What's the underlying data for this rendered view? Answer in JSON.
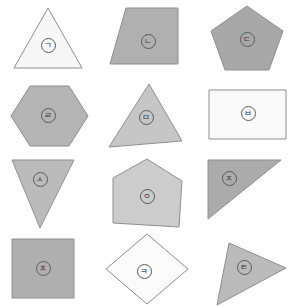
{
  "canvas": {
    "width": 297,
    "height": 306,
    "background": "#ffffff",
    "grid_columns": 3,
    "grid_rows": 4
  },
  "style": {
    "stroke_color": "#8f8f8f",
    "stroke_width": 1,
    "label_ring_color": "#5a5a5a",
    "label_text_color": "#3a3a3a"
  },
  "shapes": [
    {
      "label": "ㄱ",
      "name": "triangle",
      "fill": "#f7f7f7",
      "cell": {
        "col": 0,
        "row": 0
      },
      "points": "33,6 63,6 63,6",
      "polygon": "48,8 14,68 82,68",
      "label_pos": {
        "x": 48,
        "y": 45
      }
    },
    {
      "label": "ㄴ",
      "name": "quadrilateral",
      "fill": "#b0b0b0",
      "cell": {
        "col": 1,
        "row": 0
      },
      "polygon": "27,8 79,8 79,64 11,64",
      "label_pos": {
        "x": 49,
        "y": 41
      }
    },
    {
      "label": "ㄷ",
      "name": "pentagon",
      "fill": "#a8a8a8",
      "cell": {
        "col": 2,
        "row": 0
      },
      "polygon": "49,6 85,31 71,70 27,70 13,31",
      "label_pos": {
        "x": 49,
        "y": 39
      }
    },
    {
      "label": "ㄹ",
      "name": "hexagon",
      "fill": "#b4b4b4",
      "cell": {
        "col": 0,
        "row": 1
      },
      "polygon": "30,9 69,9 88,39 69,69 30,69 11,39",
      "label_pos": {
        "x": 48,
        "y": 39
      }
    },
    {
      "label": "ㅁ",
      "name": "triangle",
      "fill": "#c6c6c6",
      "cell": {
        "col": 1,
        "row": 1
      },
      "polygon": "50,7 83,64 10,70",
      "label_pos": {
        "x": 47,
        "y": 41
      }
    },
    {
      "label": "ㅂ",
      "name": "rectangle",
      "fill": "#fafafa",
      "cell": {
        "col": 2,
        "row": 1
      },
      "polygon": "11,13 88,13 88,62 11,62",
      "label_pos": {
        "x": 50,
        "y": 37
      }
    },
    {
      "label": "ㅅ",
      "name": "inverted-triangle",
      "fill": "#bbbbbb",
      "cell": {
        "col": 0,
        "row": 2
      },
      "polygon": "12,7 74,7 40,75",
      "label_pos": {
        "x": 40,
        "y": 26
      }
    },
    {
      "label": "ㅇ",
      "name": "house-pentagon",
      "fill": "#cccccc",
      "cell": {
        "col": 1,
        "row": 2
      },
      "polygon": "48,6 83,28 80,74 14,70 14,25",
      "label_pos": {
        "x": 48,
        "y": 43
      }
    },
    {
      "label": "ㅈ",
      "name": "right-triangle",
      "fill": "#ababab",
      "cell": {
        "col": 2,
        "row": 2
      },
      "polygon": "10,7 83,7 10,66",
      "label_pos": {
        "x": 31,
        "y": 25
      }
    },
    {
      "label": "ㅊ",
      "name": "square",
      "fill": "#afafaf",
      "cell": {
        "col": 0,
        "row": 3
      },
      "polygon": "12,9 74,9 74,68 12,68",
      "label_pos": {
        "x": 43,
        "y": 39
      }
    },
    {
      "label": "ㅋ",
      "name": "diamond",
      "fill": "#fbfbfb",
      "cell": {
        "col": 1,
        "row": 3
      },
      "polygon": "48,4 89,39 48,74 7,39",
      "label_pos": {
        "x": 45,
        "y": 42
      }
    },
    {
      "label": "ㅌ",
      "name": "triangle",
      "fill": "#bbbbbb",
      "cell": {
        "col": 2,
        "row": 3
      },
      "polygon": "31,13 88,38 19,75",
      "label_pos": {
        "x": 46,
        "y": 38
      }
    }
  ]
}
